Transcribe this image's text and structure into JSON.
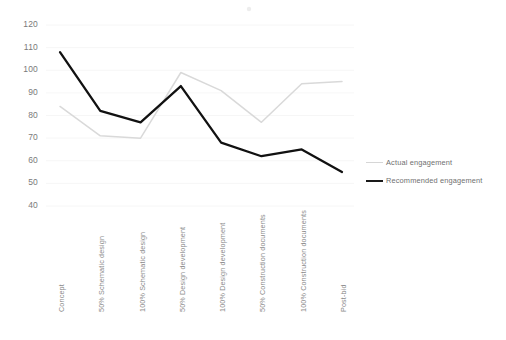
{
  "chart_data": {
    "type": "line",
    "title": "",
    "xlabel": "",
    "ylabel": "",
    "ylim": [
      40,
      120
    ],
    "yticks": [
      40,
      50,
      60,
      70,
      80,
      90,
      100,
      110,
      120
    ],
    "grid": true,
    "legend_position": "right",
    "categories": [
      "Concept",
      "50% Schematic design",
      "100% Schematic design",
      "50% Design development",
      "100% Design development",
      "50% Construction documents",
      "100% Construction documents",
      "Post-bid"
    ],
    "series": [
      {
        "name": "Actual engagement",
        "color": "#d9d9d9",
        "values": [
          84,
          71,
          70,
          99,
          91,
          77,
          94,
          95
        ]
      },
      {
        "name": "Recommended engagement",
        "color": "#111111",
        "values": [
          108,
          82,
          77,
          93,
          68,
          62,
          65,
          55
        ]
      }
    ]
  },
  "legend": {
    "items": [
      {
        "label": "Actual engagement"
      },
      {
        "label": "Recommended engagement"
      }
    ]
  }
}
